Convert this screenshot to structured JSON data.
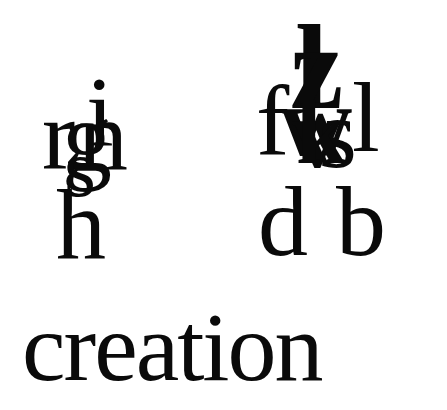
{
  "artwork": {
    "word": "creation",
    "left_cluster": {
      "glyphs": [
        "i",
        "r",
        "n",
        "g",
        "s",
        "h",
        "k"
      ]
    },
    "right_cluster": {
      "glyphs": [
        "l",
        "z",
        "f",
        "w",
        "v",
        "s",
        "l",
        "k",
        "d",
        "b"
      ]
    },
    "ink_color": "#0a0a0a",
    "background_color": "#ffffff"
  }
}
